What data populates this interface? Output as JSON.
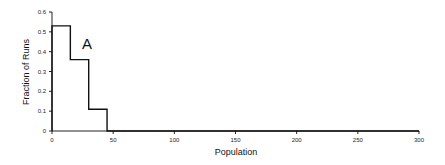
{
  "chart_data": {
    "type": "line",
    "style": "step",
    "title": "",
    "panel_label": "A",
    "xlabel": "Population",
    "ylabel": "Fraction of Runs",
    "xlim": [
      0,
      300
    ],
    "ylim": [
      0,
      0.6
    ],
    "xticks": [
      0,
      50,
      100,
      150,
      200,
      250,
      300
    ],
    "yticks": [
      0,
      0.1,
      0.2,
      0.3,
      0.4,
      0.5,
      0.6
    ],
    "xtick_labels": [
      "0",
      "50",
      "100",
      "150",
      "200",
      "250",
      "300"
    ],
    "ytick_labels": [
      "0",
      "0.1",
      "0.2",
      "0.3",
      "0.4",
      "0.5",
      "0.6"
    ],
    "grid": false,
    "legend": null,
    "series": [
      {
        "name": "A",
        "bins": [
          {
            "x0": 0,
            "x1": 15,
            "value": 0.53
          },
          {
            "x0": 15,
            "x1": 30,
            "value": 0.36
          },
          {
            "x0": 30,
            "x1": 45,
            "value": 0.11
          },
          {
            "x0": 45,
            "x1": 300,
            "value": 0
          }
        ]
      }
    ]
  }
}
